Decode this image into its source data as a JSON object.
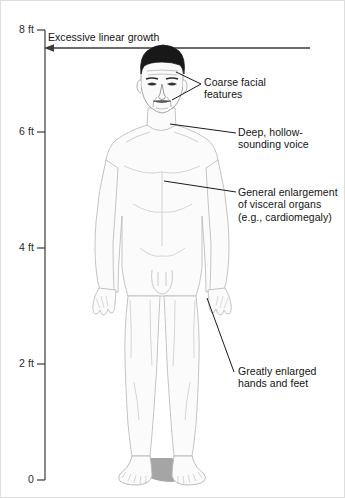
{
  "figure": {
    "background_color": "#ffffff",
    "border_color": "#d8d8d8",
    "line_color": "#1a1a1a",
    "body_outline_color": "#b9b9b9",
    "hair_color": "#1c1c1c",
    "shadow_color": "#a8a8a8"
  },
  "axis": {
    "name": "height-scale",
    "unit": "ft",
    "orientation": "vertical",
    "axis_line_color": "#3a3a3a",
    "ticks": [
      {
        "label": "8 ft",
        "value": 8,
        "y": 30
      },
      {
        "label": "6 ft",
        "value": 6,
        "y": 132
      },
      {
        "label": "4 ft",
        "value": 4,
        "y": 248
      },
      {
        "label": "2 ft",
        "value": 2,
        "y": 364
      },
      {
        "label": "0",
        "value": 0,
        "y": 480
      }
    ]
  },
  "growth_arrow": {
    "name": "excessive-linear-growth-arrow",
    "label": "Excessive linear growth",
    "direction": "left",
    "label_x": 48,
    "label_y": 32,
    "line_y": 48,
    "line_x_start": 45,
    "line_x_end": 310
  },
  "callouts": [
    {
      "id": "coarse-facial-features",
      "text": "Coarse facial\nfeatures",
      "text_x": 204,
      "text_y": 76,
      "leader": "M 201 84 L 174 73 M 201 84 L 170 100"
    },
    {
      "id": "deep-hollow-sounding-voice",
      "text": "Deep, hollow-\nsounding voice",
      "text_x": 238,
      "text_y": 126,
      "leader": "M 236 133 L 172 125"
    },
    {
      "id": "general-enlargement-of-visceral-organs",
      "text": "General enlargement\nof visceral organs\n(e.g., cardiomegaly)",
      "text_x": 238,
      "text_y": 186,
      "leader": "M 236 192 L 165 182"
    },
    {
      "id": "greatly-enlarged-hands-and-feet",
      "text": "Greatly enlarged\nhands and feet",
      "text_x": 238,
      "text_y": 365,
      "leader": "M 234 372 L 206 300"
    }
  ],
  "figure_body": {
    "name": "male-figure-illustration",
    "description": "Front-facing adult male figure standing, drawn in light gray outline with detailed shaded face and dark hair"
  }
}
